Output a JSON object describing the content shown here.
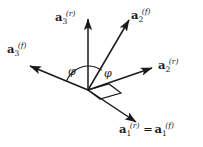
{
  "figure": {
    "background_color": "#ffffff",
    "line_color": "#1a1a1a",
    "text_color": "#1a1a1a",
    "width": 203,
    "height": 147,
    "origin": {
      "x": 88,
      "y": 90
    },
    "caption_partial": ""
  },
  "vectors": [
    {
      "id": "a3r",
      "name": "a3-reference",
      "symbol": "a",
      "subscript": "3",
      "superscript": "(r)",
      "label_text": "a3(r)",
      "tip": {
        "x": 88,
        "y": 16
      },
      "direction_deg": 90,
      "label_position": {
        "x": 55,
        "y": 12
      }
    },
    {
      "id": "a2f",
      "name": "a2-fixed",
      "symbol": "a",
      "subscript": "2",
      "superscript": "(f)",
      "label_text": "a2(f)",
      "tip": {
        "x": 131,
        "y": 17
      },
      "direction_deg": 56,
      "label_position": {
        "x": 131,
        "y": 10
      }
    },
    {
      "id": "a3f",
      "name": "a3-fixed",
      "symbol": "a",
      "subscript": "3",
      "superscript": "(f)",
      "label_text": "a3(f)",
      "tip": {
        "x": 27,
        "y": 65
      },
      "direction_deg": 157,
      "label_position": {
        "x": 7,
        "y": 44
      }
    },
    {
      "id": "a2r",
      "name": "a2-reference",
      "symbol": "a",
      "subscript": "2",
      "superscript": "(r)",
      "label_text": "a2(r)",
      "tip": {
        "x": 155,
        "y": 67
      },
      "direction_deg": 19,
      "label_position": {
        "x": 158,
        "y": 60
      }
    },
    {
      "id": "a1",
      "name": "a1-reference-equals-fixed",
      "symbol": "a",
      "subscript": "1",
      "superscript": "(r)",
      "equals_symbol": "=",
      "symbol2": "a",
      "subscript2": "1",
      "superscript2": "(f)",
      "label_text": "a1(r) = a1(f)",
      "tip": {
        "x": 139,
        "y": 124
      },
      "direction_deg": -36,
      "label_position": {
        "x": 119,
        "y": 124
      }
    }
  ],
  "angles": [
    {
      "id": "phi-left",
      "name": "angle-phi-left",
      "label": "φ",
      "description": "angle between a3(f) direction and a3(r) vertical axis",
      "label_position": {
        "x": 68,
        "y": 66
      }
    },
    {
      "id": "phi-right",
      "name": "angle-phi-right",
      "label": "φ",
      "description": "angle between a3(r) vertical axis and a2(f)",
      "label_position": {
        "x": 104,
        "y": 68
      }
    }
  ],
  "markers": [
    {
      "id": "right-angle-parallelogram",
      "name": "right-angle-marker",
      "description": "parallelogram marker at origin indicating perpendicular plane"
    }
  ]
}
